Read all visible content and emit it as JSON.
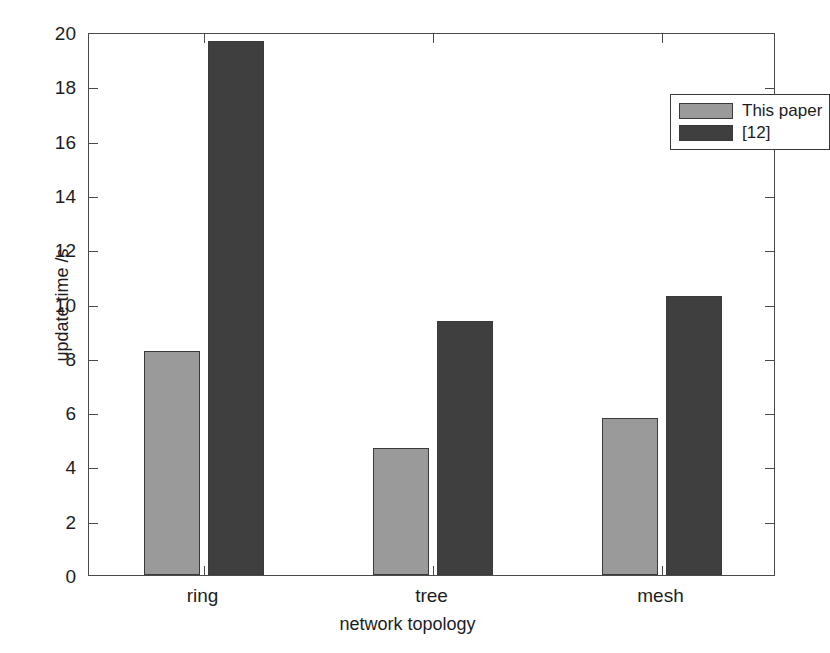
{
  "chart_data": {
    "type": "bar",
    "title": "",
    "subtitle": "",
    "xlabel": "network topology",
    "ylabel": "update time /s",
    "categories": [
      "ring",
      "tree",
      "mesh"
    ],
    "series": [
      {
        "name": "This paper",
        "color": "#9a9a9a",
        "values": [
          8.25,
          4.68,
          5.78
        ]
      },
      {
        "name": "[12]",
        "color": "#3f3f3f",
        "values": [
          19.67,
          9.35,
          10.28
        ]
      }
    ],
    "ylim": [
      0,
      20
    ],
    "yticks": [
      0,
      2,
      4,
      6,
      8,
      10,
      12,
      14,
      16,
      18,
      20
    ],
    "ytick_labels": [
      "0",
      "2",
      "4",
      "6",
      "8",
      "10",
      "12",
      "14",
      "16",
      "18",
      "20"
    ],
    "grid": false,
    "legend_position": "top-right",
    "legend_entries": [
      "This paper",
      "[12]"
    ],
    "axis_color": "#4a4a4a",
    "background": "#ffffff"
  }
}
